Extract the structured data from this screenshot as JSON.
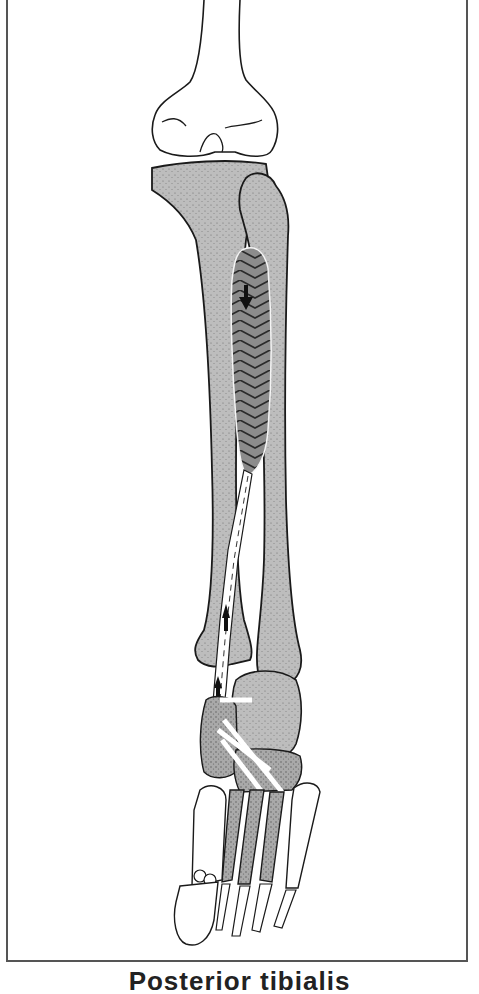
{
  "figure": {
    "structures": [
      {
        "id": "femur",
        "label": "Femur (distal)",
        "fill": "#ffffff"
      },
      {
        "id": "tibia",
        "label": "Tibia",
        "fill": "#b9b9b9"
      },
      {
        "id": "fibula",
        "label": "Fibula",
        "fill": "#b9b9b9"
      },
      {
        "id": "muscle",
        "label": "Muscle belly (pennate)",
        "fill": "#8a8a8a"
      },
      {
        "id": "tendon",
        "label": "Tendon (white, dashed centerline)",
        "fill": "#ffffff"
      },
      {
        "id": "tarsals",
        "label": "Tarsal bones",
        "fill": "#b0b0b0"
      },
      {
        "id": "metatarsals",
        "label": "Metatarsals",
        "fill": "#a8a8a8"
      },
      {
        "id": "phalanges",
        "label": "Phalanges",
        "fill": "#ffffff"
      }
    ],
    "arrows": [
      {
        "id": "muscle-contraction-arrow",
        "direction": "down"
      },
      {
        "id": "tendon-upper-arrow",
        "direction": "up"
      },
      {
        "id": "tendon-lower-arrow",
        "direction": "up"
      }
    ],
    "colors": {
      "outline": "#1a1a1a",
      "bone_shade": "#b9b9b9",
      "muscle": "#8a8a8a",
      "frame": "#555555"
    }
  },
  "caption": {
    "text": "Posterior tibialis"
  }
}
